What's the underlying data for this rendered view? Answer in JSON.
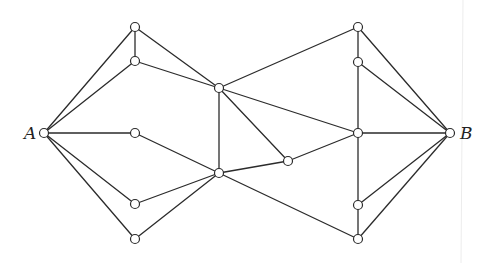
{
  "diagram": {
    "type": "graph",
    "width": 485,
    "height": 263,
    "colors": {
      "edge": "#2b2b2b",
      "node_fill": "#ffffff",
      "node_stroke": "#2b2b2b",
      "label": "#222222",
      "background": "#ffffff"
    },
    "node_radius": 4.5,
    "nodes": [
      {
        "id": "A",
        "x": 44,
        "y": 133,
        "label": "A",
        "label_x": 24,
        "label_y": 139
      },
      {
        "id": "L1",
        "x": 135,
        "y": 27
      },
      {
        "id": "L2",
        "x": 135,
        "y": 61
      },
      {
        "id": "L3",
        "x": 135,
        "y": 133
      },
      {
        "id": "L4",
        "x": 135,
        "y": 204
      },
      {
        "id": "L5",
        "x": 135,
        "y": 239
      },
      {
        "id": "C1",
        "x": 219,
        "y": 88
      },
      {
        "id": "C2",
        "x": 219,
        "y": 173
      },
      {
        "id": "P",
        "x": 288,
        "y": 161
      },
      {
        "id": "R1",
        "x": 358,
        "y": 27
      },
      {
        "id": "R2",
        "x": 358,
        "y": 62
      },
      {
        "id": "R3",
        "x": 358,
        "y": 133
      },
      {
        "id": "R4",
        "x": 358,
        "y": 205
      },
      {
        "id": "R5",
        "x": 358,
        "y": 239
      },
      {
        "id": "B",
        "x": 450,
        "y": 133,
        "label": "B",
        "label_x": 460,
        "label_y": 139
      }
    ],
    "edges": [
      [
        "A",
        "L1"
      ],
      [
        "A",
        "L2"
      ],
      [
        "A",
        "L3"
      ],
      [
        "A",
        "L4"
      ],
      [
        "A",
        "L5"
      ],
      [
        "L1",
        "L2"
      ],
      [
        "L1",
        "C1"
      ],
      [
        "L2",
        "C1"
      ],
      [
        "L3",
        "C2"
      ],
      [
        "L4",
        "C2"
      ],
      [
        "L5",
        "C2"
      ],
      [
        "C1",
        "C2"
      ],
      [
        "C1",
        "R1"
      ],
      [
        "C1",
        "R3"
      ],
      [
        "C1",
        "P"
      ],
      [
        "C2",
        "P"
      ],
      [
        "C2",
        "R5"
      ],
      [
        "P",
        "R3"
      ],
      [
        "R1",
        "R2"
      ],
      [
        "R2",
        "R3"
      ],
      [
        "R3",
        "R4"
      ],
      [
        "R4",
        "R5"
      ],
      [
        "R1",
        "B"
      ],
      [
        "R2",
        "B"
      ],
      [
        "R3",
        "B"
      ],
      [
        "R4",
        "B"
      ],
      [
        "R5",
        "B"
      ]
    ]
  }
}
